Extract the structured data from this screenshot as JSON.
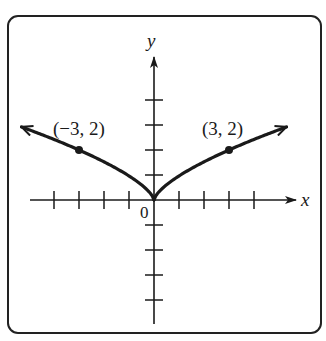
{
  "chart_data": {
    "type": "line",
    "title": "",
    "xlabel": "x",
    "ylabel": "y",
    "origin_label": "0",
    "xlim": [
      -5.3,
      5.3
    ],
    "ylim": [
      -5,
      5
    ],
    "x_ticks": [
      -5,
      -4,
      -3,
      -2,
      -1,
      1,
      2,
      3,
      4
    ],
    "y_ticks": [
      -5,
      -4,
      -3,
      -2,
      -1,
      1,
      2,
      3,
      4
    ],
    "grid": false,
    "series": [
      {
        "name": "y = 2(|x|/3)^(2/3)",
        "x": [
          -5.3,
          -4,
          -3,
          -2,
          -1,
          -0.5,
          0,
          0.5,
          1,
          2,
          3,
          4,
          5.3
        ],
        "values": [
          2.92,
          2.42,
          2.0,
          1.53,
          0.96,
          0.61,
          0,
          0.61,
          0.96,
          1.53,
          2.0,
          2.42,
          2.92
        ],
        "arrows_at_ends": true
      }
    ],
    "annotations": [
      {
        "point": [
          -3,
          2
        ],
        "label": "(−3, 2)"
      },
      {
        "point": [
          3,
          2
        ],
        "label": "(3, 2)"
      }
    ]
  },
  "labels": {
    "x_axis": "x",
    "y_axis": "y",
    "origin": "0",
    "point_left": "(−3, 2)",
    "point_right": "(3, 2)"
  },
  "colors": {
    "ink": "#1a1a1a",
    "background": "#ffffff"
  }
}
